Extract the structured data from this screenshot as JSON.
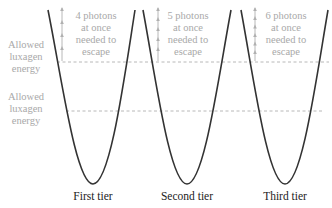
{
  "diagram": {
    "left_labels": {
      "upper": [
        "Allowed",
        "luxagen",
        "energy"
      ],
      "lower": [
        "Allowed",
        "luxagen",
        "energy"
      ]
    },
    "tiers": [
      {
        "name": "First tier",
        "escape_note": [
          "4 photons",
          "at once",
          "needed to",
          "escape"
        ],
        "photons": 4
      },
      {
        "name": "Second tier",
        "escape_note": [
          "5 photons",
          "at once",
          "needed to",
          "escape"
        ],
        "photons": 5
      },
      {
        "name": "Third tier",
        "escape_note": [
          "6 photons",
          "at once",
          "needed to",
          "escape"
        ],
        "photons": 6
      }
    ],
    "colors": {
      "well_stroke": "#333333",
      "annotation_gray": "#a9a9a9",
      "label_text": "#222222"
    }
  }
}
